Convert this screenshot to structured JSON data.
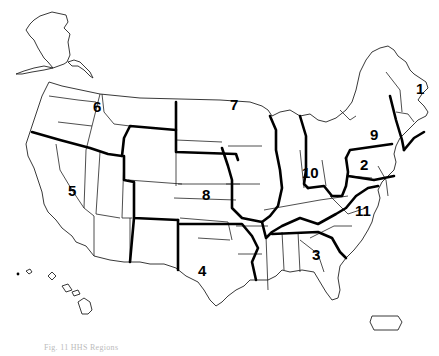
{
  "map": {
    "title": "US regions map",
    "regions": [
      {
        "id": "1",
        "label": "1",
        "x": 416,
        "y": 88
      },
      {
        "id": "2",
        "label": "2",
        "x": 364,
        "y": 166
      },
      {
        "id": "3",
        "label": "3",
        "x": 316,
        "y": 256
      },
      {
        "id": "4",
        "label": "4",
        "x": 202,
        "y": 272
      },
      {
        "id": "5",
        "label": "5",
        "x": 71,
        "y": 193
      },
      {
        "id": "6",
        "label": "6",
        "x": 93,
        "y": 108
      },
      {
        "id": "7",
        "label": "7",
        "x": 230,
        "y": 105
      },
      {
        "id": "8",
        "label": "8",
        "x": 202,
        "y": 198
      },
      {
        "id": "9",
        "label": "9",
        "x": 372,
        "y": 136
      },
      {
        "id": "10",
        "label": "10",
        "x": 303,
        "y": 172
      },
      {
        "id": "11",
        "label": "11",
        "x": 362,
        "y": 212
      }
    ],
    "line_color": "#000000",
    "background": "#ffffff"
  },
  "caption": "Fig. 11 HHS Regions"
}
